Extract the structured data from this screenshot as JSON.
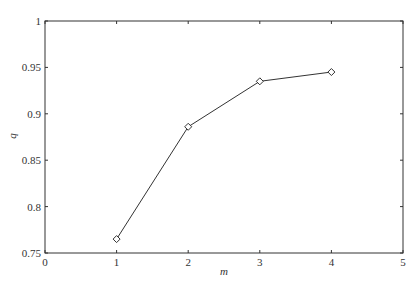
{
  "chart_data": {
    "type": "line",
    "title": "",
    "xlabel": "m",
    "ylabel": "q",
    "xlim": [
      0,
      5
    ],
    "ylim": [
      0.75,
      1
    ],
    "x_ticks": [
      "0",
      "1",
      "2",
      "3",
      "4",
      "5"
    ],
    "y_ticks": [
      "0.75",
      "0.8",
      "0.85",
      "0.9",
      "0.95",
      "1"
    ],
    "grid": false,
    "legend": null,
    "series": [
      {
        "name": "q",
        "marker": "diamond",
        "color": "#333333",
        "x": [
          1,
          2,
          3,
          4
        ],
        "values": [
          0.765,
          0.886,
          0.935,
          0.945
        ]
      }
    ]
  }
}
